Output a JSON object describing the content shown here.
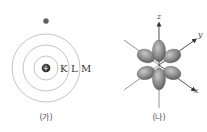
{
  "panels": [
    {
      "id": "bohr-model",
      "caption": "(가)",
      "shell_labels": [
        "K",
        "L",
        "M"
      ],
      "nucleus_sign": "+",
      "electron_count_shown": 1
    },
    {
      "id": "orbital-model",
      "caption": "(나)",
      "axes": {
        "x": "x",
        "y": "y",
        "z": "z"
      }
    }
  ],
  "colors": {
    "orbit_stroke": "#bdbdbd",
    "nucleus": "#2b2b2b",
    "electron": "#555555",
    "lobe_dark": "#6e6e6e",
    "lobe_light": "#b8b8b8",
    "axis_stroke": "#7a7a7a",
    "text": "#333333"
  }
}
